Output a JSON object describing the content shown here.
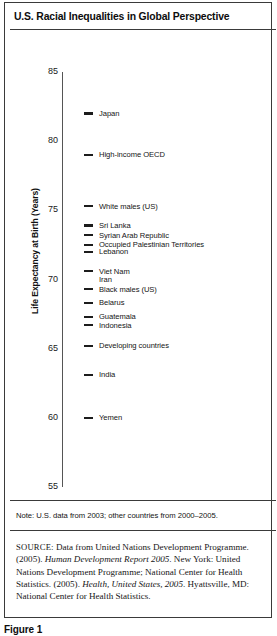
{
  "figure": {
    "title": "U.S. Racial Inequalities in Global Perspective",
    "note": "Note: U.S. data from 2003; other countries from 2000–2005.",
    "source_label": "SOURCE",
    "source_text_1": ": Data from United Nations Development Programme. (2005). ",
    "source_italic_1": "Human Development Report 2005",
    "source_text_2": ". New York: United Nations Development Programme; National Center for Health Statistics. (2005). ",
    "source_italic_2": "Health, United States, 2005",
    "source_text_3": ". Hyattsville, MD: National Center for Health Statistics.",
    "caption": "Figure 1"
  },
  "chart_data": {
    "type": "scatter",
    "title": "U.S. Racial Inequalities in Global Perspective",
    "xlabel": "",
    "ylabel": "Life Expectancy at Birth (Years)",
    "ylim": [
      55,
      85
    ],
    "yticks": [
      85,
      80,
      75,
      70,
      65,
      60,
      55
    ],
    "ytick_labels": [
      "85",
      "80",
      "75",
      "70",
      "65",
      "60",
      "55"
    ],
    "grid": false,
    "legend": "none",
    "marker_style": "horizontal-dash",
    "categories": [
      "Japan",
      "High-income OECD",
      "White males (US)",
      "Sri Lanka",
      "Syrian Arab Republic",
      "Occupied Palestinian Territories",
      "Lebanon",
      "Viet Nam",
      "Iran",
      "Black males (US)",
      "Belarus",
      "Guatemala",
      "Indonesia",
      "Developing countries",
      "India",
      "Yemen"
    ],
    "values": [
      82.0,
      79.0,
      75.3,
      73.9,
      73.2,
      72.5,
      72.0,
      70.6,
      70.6,
      69.3,
      68.3,
      67.3,
      66.7,
      65.2,
      63.1,
      60.0
    ],
    "points": [
      {
        "label": "Japan",
        "value": 82.0,
        "has_marker": true
      },
      {
        "label": "High-income OECD",
        "value": 79.0,
        "has_marker": true
      },
      {
        "label": "White males (US)",
        "value": 75.3,
        "has_marker": true
      },
      {
        "label": "Sri Lanka",
        "value": 73.9,
        "has_marker": true
      },
      {
        "label": "Syrian Arab Republic",
        "value": 73.2,
        "has_marker": true
      },
      {
        "label": "Occupied Palestinian Territories",
        "value": 72.5,
        "has_marker": true
      },
      {
        "label": "Lebanon",
        "value": 72.0,
        "has_marker": true
      },
      {
        "label": "Viet Nam",
        "value": 70.6,
        "has_marker": true
      },
      {
        "label": "Iran",
        "value": 70.6,
        "has_marker": false
      },
      {
        "label": "Black males (US)",
        "value": 69.3,
        "has_marker": true
      },
      {
        "label": "Belarus",
        "value": 68.3,
        "has_marker": true
      },
      {
        "label": "Guatemala",
        "value": 67.3,
        "has_marker": true
      },
      {
        "label": "Indonesia",
        "value": 66.7,
        "has_marker": true
      },
      {
        "label": "Developing countries",
        "value": 65.2,
        "has_marker": true
      },
      {
        "label": "India",
        "value": 63.1,
        "has_marker": true
      },
      {
        "label": "Yemen",
        "value": 60.0,
        "has_marker": true
      }
    ]
  },
  "colors": {
    "marker": "#1c1c1c",
    "axis": "#555555",
    "border": "#3a3a3a",
    "text": "#141414"
  }
}
